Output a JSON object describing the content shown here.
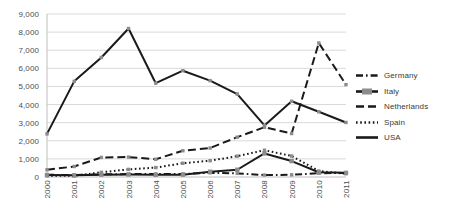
{
  "chart_data": {
    "type": "line",
    "title": "",
    "subtitle": "",
    "xlabel": "",
    "ylabel": "",
    "categories": [
      "2000",
      "2001",
      "2002",
      "2003",
      "2004",
      "2005",
      "2006",
      "2007",
      "2008",
      "2009",
      "2010",
      "2011"
    ],
    "ylim": [
      0,
      9000
    ],
    "ytick_values": [
      0,
      1000,
      2000,
      3000,
      4000,
      5000,
      6000,
      7000,
      8000,
      9000
    ],
    "ytick_labels": [
      "0",
      "1,000",
      "2,000",
      "3,000",
      "4,000",
      "5,000",
      "6,000",
      "7,000",
      "8,000",
      "9,000"
    ],
    "grid": true,
    "grid_axis": "y",
    "legend_position": "right",
    "series": [
      {
        "name": "Germany",
        "style": "dash-dot",
        "color": "#1a1a1a",
        "values": [
          120,
          110,
          150,
          160,
          170,
          170,
          230,
          200,
          110,
          120,
          210,
          220
        ]
      },
      {
        "name": "Italy",
        "style": "solid-marker",
        "color": "#1a1a1a",
        "values": [
          110,
          90,
          130,
          140,
          120,
          130,
          290,
          400,
          1300,
          880,
          260,
          230
        ]
      },
      {
        "name": "Netherlands",
        "style": "dashed",
        "color": "#1a1a1a",
        "values": [
          400,
          580,
          1080,
          1100,
          980,
          1450,
          1600,
          2200,
          2750,
          2400,
          7400,
          5100
        ]
      },
      {
        "name": "Spain",
        "style": "dotted",
        "color": "#1a1a1a",
        "values": [
          60,
          70,
          260,
          420,
          520,
          760,
          900,
          1150,
          1480,
          1160,
          330,
          180
        ]
      },
      {
        "name": "USA",
        "style": "solid",
        "color": "#1a1a1a",
        "values": [
          2380,
          5280,
          6600,
          8200,
          5180,
          5870,
          5320,
          4580,
          2850,
          4180,
          3600,
          3010
        ]
      }
    ]
  },
  "legend": {
    "entries": [
      {
        "label": "Germany"
      },
      {
        "label": "Italy"
      },
      {
        "label": "Netherlands"
      },
      {
        "label": "Spain"
      },
      {
        "label": "USA"
      }
    ]
  },
  "colors": {
    "ink": "#1a1a1a",
    "grid": "#d9d9d9",
    "axis": "#bfbfbf",
    "text": "#4d4d4d",
    "background": "#ffffff"
  }
}
